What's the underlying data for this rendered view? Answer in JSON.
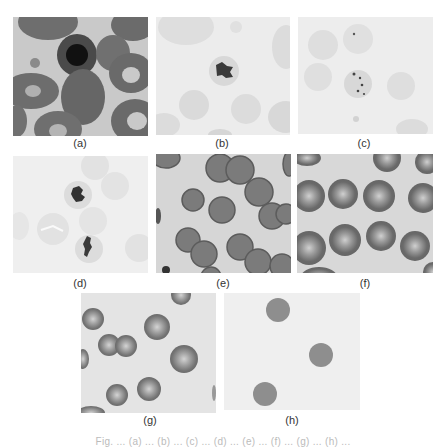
{
  "figure": {
    "panels": [
      {
        "id": "a",
        "label": "(a)",
        "description": "blood smear, nucleated cell among dark erythrocytes"
      },
      {
        "id": "b",
        "label": "(b)",
        "description": "pale field, single cell with dark inclusion"
      },
      {
        "id": "c",
        "label": "(c)",
        "description": "pale field, cell with small dotted inclusions"
      },
      {
        "id": "d",
        "label": "(d)",
        "description": "pale field, two cells with dark irregular inclusions"
      },
      {
        "id": "e",
        "label": "(e)",
        "description": "dense field of gray erythrocytes, one crenated cell"
      },
      {
        "id": "f",
        "label": "(f)",
        "description": "field of erythrocytes with pale centers"
      },
      {
        "id": "g",
        "label": "(g)",
        "description": "scattered erythrocytes with pale centers"
      },
      {
        "id": "h",
        "label": "(h)",
        "description": "three uniform gray spherical cells"
      }
    ],
    "caption": "Fig. ... (a) ... (b) ... (c) ... (d) ... (e) ... (f) ... (g) ... (h) ..."
  },
  "colors": {
    "page_bg": "#ffffff",
    "label_text": "#333333"
  }
}
